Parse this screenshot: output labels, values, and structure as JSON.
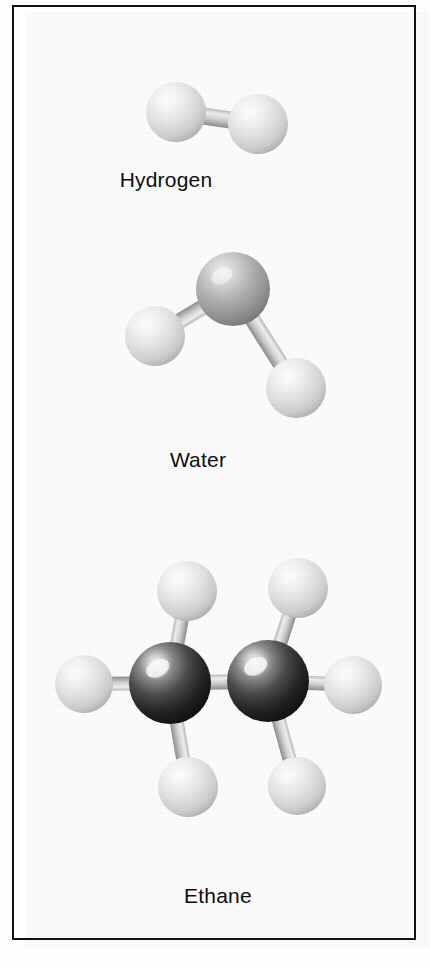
{
  "figure": {
    "kind": "molecular-models-plate",
    "background_color": "#ffffff",
    "border_color": "#111111",
    "label_color": "#0d0d0d"
  },
  "panels": [
    {
      "id": "hydrogen",
      "caption": "Hydrogen",
      "formula_atoms": [
        "H",
        "H"
      ],
      "atoms": [
        {
          "element": "H",
          "cx": 176,
          "cy": 112,
          "r": 30,
          "shade": "light"
        },
        {
          "element": "H",
          "cx": 258,
          "cy": 124,
          "r": 30,
          "shade": "light"
        }
      ],
      "bonds": [
        {
          "from": 0,
          "to": 1,
          "width": 17
        }
      ]
    },
    {
      "id": "water",
      "caption": "Water",
      "formula_atoms": [
        "H",
        "O",
        "H"
      ],
      "atoms": [
        {
          "element": "O",
          "cx": 233,
          "cy": 289,
          "r": 37,
          "shade": "mid"
        },
        {
          "element": "H",
          "cx": 155,
          "cy": 336,
          "r": 30,
          "shade": "light"
        },
        {
          "element": "H",
          "cx": 296,
          "cy": 388,
          "r": 30,
          "shade": "light"
        }
      ],
      "bonds": [
        {
          "from": 0,
          "to": 1,
          "width": 16
        },
        {
          "from": 0,
          "to": 2,
          "width": 16
        }
      ]
    },
    {
      "id": "ethane",
      "caption": "Ethane",
      "formula_atoms": [
        "C",
        "C",
        "H",
        "H",
        "H",
        "H",
        "H",
        "H"
      ],
      "atoms": [
        {
          "element": "C",
          "cx": 170,
          "cy": 683,
          "r": 41,
          "shade": "dark"
        },
        {
          "element": "C",
          "cx": 268,
          "cy": 681,
          "r": 41,
          "shade": "dark"
        },
        {
          "element": "H",
          "cx": 84,
          "cy": 684,
          "r": 29,
          "shade": "light"
        },
        {
          "element": "H",
          "cx": 187,
          "cy": 591,
          "r": 30,
          "shade": "light"
        },
        {
          "element": "H",
          "cx": 188,
          "cy": 787,
          "r": 30,
          "shade": "light"
        },
        {
          "element": "H",
          "cx": 353,
          "cy": 685,
          "r": 29,
          "shade": "light"
        },
        {
          "element": "H",
          "cx": 298,
          "cy": 588,
          "r": 30,
          "shade": "light"
        },
        {
          "element": "H",
          "cx": 297,
          "cy": 786,
          "r": 29,
          "shade": "light"
        }
      ],
      "bonds": [
        {
          "from": 0,
          "to": 1,
          "width": 15
        },
        {
          "from": 0,
          "to": 2,
          "width": 14
        },
        {
          "from": 0,
          "to": 3,
          "width": 14
        },
        {
          "from": 0,
          "to": 4,
          "width": 14
        },
        {
          "from": 1,
          "to": 5,
          "width": 14
        },
        {
          "from": 1,
          "to": 6,
          "width": 14
        },
        {
          "from": 1,
          "to": 7,
          "width": 14
        }
      ]
    }
  ],
  "palette": {
    "sphere_light_highlight": "#ffffff",
    "sphere_light_mid": "#e2e2e2",
    "sphere_light_edge": "#b2b2b2",
    "sphere_mid_highlight": "#f2f2f2",
    "sphere_mid_mid": "#adadad",
    "sphere_mid_edge": "#7c7c7c",
    "sphere_dark_highlight": "#f5f5f5",
    "sphere_dark_mid": "#4a4a4a",
    "sphere_dark_edge": "#111111",
    "bond_light": "#f0f0f0",
    "bond_mid": "#c9c9c9",
    "bond_dark": "#8d8d8d"
  }
}
